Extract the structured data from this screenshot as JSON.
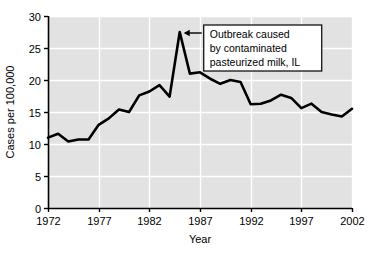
{
  "chart_data": {
    "type": "line",
    "title": "",
    "xlabel": "Year",
    "ylabel": "Cases per 100,000",
    "xlim": [
      1972,
      2002
    ],
    "ylim": [
      0,
      30
    ],
    "xticks": [
      "1972",
      "1977",
      "1982",
      "1987",
      "1992",
      "1997",
      "2002"
    ],
    "yticks": [
      "0",
      "5",
      "10",
      "15",
      "20",
      "25",
      "30"
    ],
    "grid": true,
    "legend": "none",
    "x": [
      1972,
      1973,
      1974,
      1975,
      1976,
      1977,
      1978,
      1979,
      1980,
      1981,
      1982,
      1983,
      1984,
      1985,
      1986,
      1987,
      1988,
      1989,
      1990,
      1991,
      1992,
      1993,
      1994,
      1995,
      1996,
      1997,
      1998,
      1999,
      2000,
      2001,
      2002
    ],
    "values": [
      11.0,
      11.6,
      10.4,
      10.7,
      10.7,
      13.0,
      14.0,
      15.4,
      15.0,
      17.6,
      18.2,
      19.2,
      17.4,
      27.5,
      21.0,
      21.2,
      20.2,
      19.4,
      20.0,
      19.7,
      16.2,
      16.3,
      16.8,
      17.7,
      17.2,
      15.6,
      16.3,
      15.0,
      14.6,
      14.3,
      15.5
    ],
    "series_name": "Cases per 100,000",
    "annotations": [
      {
        "name": "outbreak-annotation",
        "lines": [
          "Outbreak caused",
          "by contaminated",
          "pasteurized milk, IL"
        ],
        "point_x": 1985,
        "point_y": 27.5,
        "arrow": "left"
      }
    ],
    "colors": {
      "plot_background": "#e2e2e2",
      "gridline": "#ffffff",
      "line": "#000000",
      "axis": "#000000",
      "figure_background": "#ffffff",
      "annotation_background": "#ffffff",
      "annotation_border": "#000000"
    }
  }
}
